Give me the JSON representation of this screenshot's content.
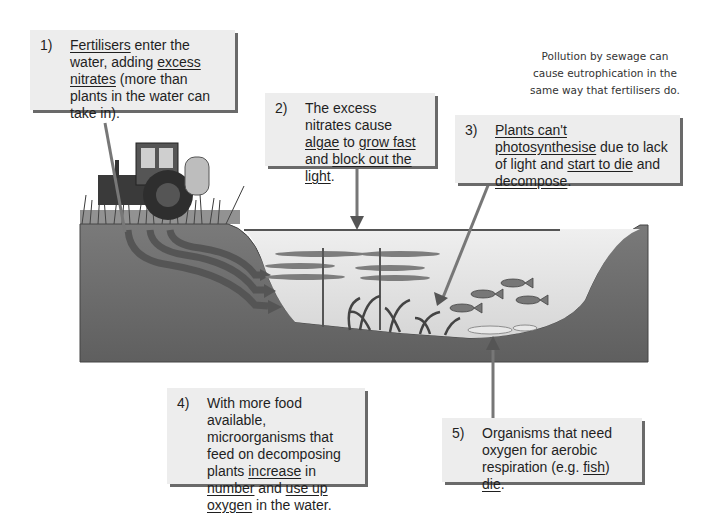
{
  "note": {
    "lines": [
      "Pollution by sewage can",
      "cause eutrophication in the",
      "same way that fertilisers do."
    ]
  },
  "steps": [
    {
      "number": "1)",
      "parts": [
        {
          "text": "Fertilisers",
          "underline": true
        },
        {
          "text": " enter the water, adding ",
          "underline": false
        },
        {
          "text": "excess nitrates",
          "underline": true
        },
        {
          "text": " (more than plants in the water can take in).",
          "underline": false
        }
      ]
    },
    {
      "number": "2)",
      "parts": [
        {
          "text": "The excess nitrates cause ",
          "underline": false
        },
        {
          "text": "algae",
          "underline": true
        },
        {
          "text": " to ",
          "underline": false
        },
        {
          "text": "grow fast",
          "underline": true
        },
        {
          "text": " and ",
          "underline": false
        },
        {
          "text": "block out the light",
          "underline": true
        },
        {
          "text": ".",
          "underline": false
        }
      ]
    },
    {
      "number": "3)",
      "parts": [
        {
          "text": "Plants can't photosynthesise",
          "underline": true
        },
        {
          "text": " due to lack of light and ",
          "underline": false
        },
        {
          "text": "start to die",
          "underline": true
        },
        {
          "text": " and ",
          "underline": false
        },
        {
          "text": "decompose",
          "underline": true
        },
        {
          "text": ".",
          "underline": false
        }
      ]
    },
    {
      "number": "4)",
      "parts": [
        {
          "text": "With more food available, microorganisms that feed on decomposing plants ",
          "underline": false
        },
        {
          "text": "increase",
          "underline": true
        },
        {
          "text": " in ",
          "underline": false
        },
        {
          "text": "number",
          "underline": true
        },
        {
          "text": " and ",
          "underline": false
        },
        {
          "text": "use up oxygen",
          "underline": true
        },
        {
          "text": " in the water.",
          "underline": false
        }
      ]
    },
    {
      "number": "5)",
      "parts": [
        {
          "text": "Organisms that need oxygen for aerobic respiration (e.g. ",
          "underline": false
        },
        {
          "text": "fish",
          "underline": true
        },
        {
          "text": ") ",
          "underline": false
        },
        {
          "text": "die",
          "underline": true
        },
        {
          "text": ".",
          "underline": false
        }
      ]
    }
  ],
  "illustration": {
    "elements": [
      "tractor",
      "grass",
      "soil-cross-section",
      "nitrate-runoff-arrows",
      "lake-water",
      "algae-layers",
      "aquatic-plants",
      "fish",
      "dead-fish"
    ],
    "colors": {
      "soil": "#6e6e6e",
      "water": "#e6e6e6",
      "runoff": "#5a5a5a",
      "pointer": "#777777",
      "box_bg": "#ededed",
      "box_shadow": "#6a6a6a"
    }
  }
}
